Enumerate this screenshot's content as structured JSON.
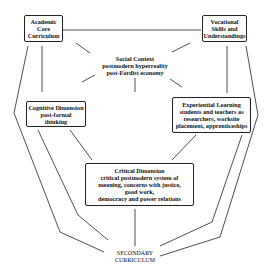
{
  "diagram": {
    "nodes": {
      "academic": {
        "lines": [
          "Academic",
          "Core",
          "Curriculum"
        ]
      },
      "vocational": {
        "lines": [
          "Vocational",
          "Skills and",
          "Understandings"
        ]
      },
      "social": {
        "title": "Social Context",
        "lines": [
          "postmodern hyperreality",
          "post-Fordist economy"
        ]
      },
      "cognitive": {
        "title": "Cognitive Dimension",
        "lines": [
          "post-formal",
          "thinking"
        ]
      },
      "experiential": {
        "title": "Experiential Learning",
        "lines": [
          "students and teachers as",
          "researchers, worksite",
          "placement, apprenticeships"
        ]
      },
      "critical": {
        "title": "Critical Dimension",
        "lines": [
          "critical postmodern system of",
          "meaning, concerns with justice,",
          "good work,",
          "democracy and power relations"
        ]
      },
      "secondary": {
        "lines": [
          "SECONDARY",
          "CURRICULUM"
        ]
      }
    },
    "colors": {
      "line": "#222222",
      "background": "#ffffff"
    }
  }
}
